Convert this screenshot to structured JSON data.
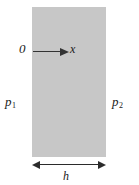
{
  "figure": {
    "background_color": "#ffffff",
    "width": 139,
    "height": 185
  },
  "slab": {
    "name": "fluid-layer",
    "fill_color": "#c7c7c7",
    "left": 32,
    "top": 7,
    "width": 74,
    "height": 150
  },
  "axis": {
    "origin_label": "0",
    "direction_label": "x",
    "arrow_color": "#333333"
  },
  "pressures": {
    "left": {
      "symbol": "p",
      "subscript": "1"
    },
    "right": {
      "symbol": "p",
      "subscript": "2"
    }
  },
  "dimension": {
    "label": "h",
    "line_color": "#2b2b2b",
    "span_px": 74
  }
}
